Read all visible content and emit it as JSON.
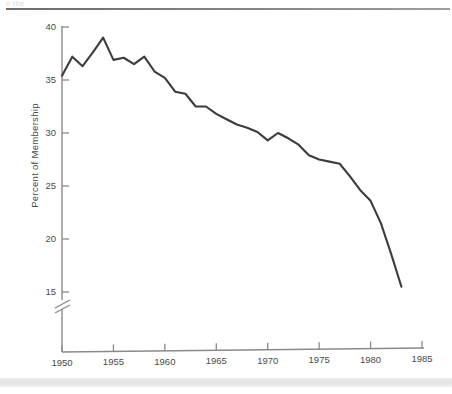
{
  "page": {
    "top_clipped_text": "n the",
    "background_color": "#ffffff"
  },
  "chart_data": {
    "type": "line",
    "title": "",
    "subtitle": "",
    "xlabel": "",
    "ylabel": "Percent of  Membership",
    "x": [
      1950,
      1951,
      1952,
      1953,
      1954,
      1955,
      1956,
      1957,
      1958,
      1959,
      1960,
      1961,
      1962,
      1963,
      1964,
      1965,
      1966,
      1967,
      1968,
      1969,
      1970,
      1971,
      1972,
      1973,
      1974,
      1975,
      1976,
      1977,
      1978,
      1979,
      1980,
      1981,
      1982,
      1983
    ],
    "values": [
      35.4,
      37.2,
      36.3,
      37.6,
      39.0,
      36.9,
      37.1,
      36.5,
      37.2,
      35.8,
      35.2,
      33.9,
      33.7,
      32.5,
      32.5,
      31.8,
      31.3,
      30.8,
      30.5,
      30.1,
      29.3,
      30.0,
      29.5,
      28.9,
      27.9,
      27.5,
      27.3,
      27.1,
      25.9,
      24.6,
      23.6,
      21.5,
      18.6,
      15.5
    ],
    "series": [
      {
        "name": "Percent of Membership",
        "color": "#3c3c3c",
        "values": [
          35.4,
          37.2,
          36.3,
          37.6,
          39.0,
          36.9,
          37.1,
          36.5,
          37.2,
          35.8,
          35.2,
          33.9,
          33.7,
          32.5,
          32.5,
          31.8,
          31.3,
          30.8,
          30.5,
          30.1,
          29.3,
          30.0,
          29.5,
          28.9,
          27.9,
          27.5,
          27.3,
          27.1,
          25.9,
          24.6,
          23.6,
          21.5,
          18.6,
          15.5
        ]
      }
    ],
    "xlim": [
      1950,
      1985
    ],
    "ylim": [
      15,
      40
    ],
    "xticks": [
      1950,
      1955,
      1960,
      1965,
      1970,
      1975,
      1980,
      1985
    ],
    "xtick_labels": [
      "1950",
      "1955",
      "1960",
      "1965",
      "1970",
      "1975",
      "1980",
      "1985"
    ],
    "yticks": [
      15,
      20,
      25,
      30,
      35,
      40
    ],
    "ytick_labels": [
      "15",
      "20",
      "25",
      "30",
      "35",
      "40"
    ],
    "grid": false,
    "legend": null,
    "axis_break": {
      "axis": "y",
      "present": true,
      "description": "double-slash break below 15 on the vertical axis"
    },
    "annotations": [],
    "line_color": "#3c3c3c",
    "axis_color": "#8a8a8a",
    "text_color": "#4a4a4a"
  }
}
